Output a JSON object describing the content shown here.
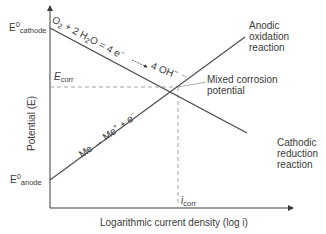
{
  "diagram": {
    "type": "evans_diagram",
    "axes": {
      "y_label": "Potential (E)",
      "x_label": "Logarithmic current density (log i)"
    },
    "y_markers": {
      "e_cathode_main": "E",
      "e_cathode_sup": "0",
      "e_cathode_sub": "cathode",
      "e_corr_main": "E",
      "e_corr_sub": "corr",
      "e_anode_main": "E",
      "e_anode_sup": "0",
      "e_anode_sub": "anode"
    },
    "x_markers": {
      "i_corr_main": "i",
      "i_corr_sub": "corr"
    },
    "lines": {
      "cathodic": {
        "label_lines": [
          "Cathodic",
          "reduction",
          "reaction"
        ],
        "equation": {
          "o2": "O",
          "o2_sub": "2",
          "mid": " + 2 H",
          "h2o_sub": "2",
          "rest": "O = 4 e",
          "e_sup": "−",
          "arrow": " → ",
          "product": "4 OH",
          "oh_sup": "−"
        }
      },
      "anodic": {
        "label_lines": [
          "Anodic",
          "oxidation",
          "reaction"
        ],
        "equation": {
          "reactant": "Me",
          "arrow": " → ",
          "product": "Me",
          "plus_sup": "+",
          "rest": " + e",
          "e_sup": "−"
        }
      }
    },
    "intersection": {
      "label_lines": [
        "Mixed corrosion",
        "potential"
      ]
    },
    "colors": {
      "line": "#4a4a4a",
      "dashed": "#9a9a9a",
      "text": "#3a3a3a"
    }
  }
}
